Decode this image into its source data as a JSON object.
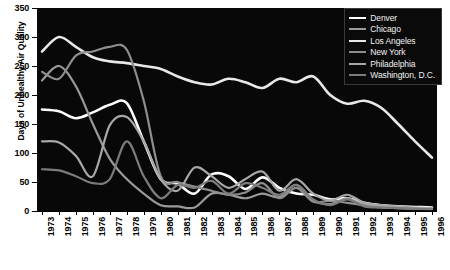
{
  "chart_data": {
    "type": "line",
    "xlabel": "",
    "ylabel": "Days of Unhealthy Air Quality",
    "xlim": [
      1973,
      1996
    ],
    "ylim": [
      0,
      350
    ],
    "ytick_step": 50,
    "grid": false,
    "legend_position": "top-right",
    "background": "#080808",
    "x": [
      1973,
      1974,
      1975,
      1976,
      1977,
      1978,
      1979,
      1980,
      1981,
      1982,
      1983,
      1984,
      1985,
      1986,
      1987,
      1988,
      1989,
      1990,
      1991,
      1992,
      1993,
      1994,
      1995,
      1996
    ],
    "categories": [
      "1973",
      "1974",
      "1975",
      "1976",
      "1977",
      "1978",
      "1979",
      "1980",
      "1981",
      "1982",
      "1983",
      "1984",
      "1985",
      "1986",
      "1987",
      "1988",
      "1989",
      "1990",
      "1991",
      "1992",
      "1993",
      "1994",
      "1995",
      "1996"
    ],
    "series": [
      {
        "name": "Denver",
        "color": "#ffffff",
        "width": 2.6,
        "values": [
          175,
          172,
          160,
          170,
          183,
          186,
          120,
          55,
          47,
          30,
          63,
          60,
          38,
          58,
          40,
          30,
          28,
          20,
          22,
          14,
          10,
          8,
          7,
          6
        ]
      },
      {
        "name": "Chicago",
        "color": "#9a9a9a",
        "width": 2.2,
        "values": [
          225,
          250,
          215,
          150,
          90,
          55,
          30,
          10,
          8,
          6,
          30,
          28,
          22,
          30,
          24,
          45,
          18,
          12,
          22,
          10,
          6,
          5,
          4,
          4
        ]
      },
      {
        "name": "Los Angeles",
        "color": "#e8e8e8",
        "width": 2.6,
        "values": [
          275,
          300,
          283,
          265,
          258,
          255,
          250,
          245,
          232,
          222,
          218,
          228,
          222,
          212,
          228,
          222,
          232,
          200,
          185,
          190,
          178,
          150,
          120,
          92
        ]
      },
      {
        "name": "New York",
        "color": "#8e8e8e",
        "width": 2.2,
        "values": [
          240,
          228,
          268,
          275,
          283,
          278,
          190,
          60,
          50,
          42,
          35,
          28,
          32,
          48,
          22,
          40,
          16,
          18,
          14,
          10,
          8,
          6,
          5,
          4
        ]
      },
      {
        "name": "Philadelphia",
        "color": "#a8a8a8",
        "width": 2.2,
        "values": [
          120,
          118,
          95,
          60,
          148,
          162,
          120,
          55,
          35,
          75,
          60,
          40,
          55,
          68,
          35,
          55,
          30,
          18,
          28,
          14,
          10,
          8,
          6,
          5
        ]
      },
      {
        "name": "Washington, D.C.",
        "color": "#7c7c7c",
        "width": 2.2,
        "values": [
          72,
          70,
          60,
          48,
          55,
          120,
          60,
          22,
          45,
          40,
          52,
          30,
          48,
          40,
          28,
          45,
          20,
          10,
          20,
          8,
          6,
          5,
          4,
          3
        ]
      }
    ]
  },
  "y_axis": {
    "ticks": [
      "0",
      "50",
      "100",
      "150",
      "200",
      "250",
      "300",
      "350"
    ],
    "title": "Days of Unhealthy Air Quality"
  },
  "legend": {
    "items": [
      {
        "label": "Denver"
      },
      {
        "label": "Chicago"
      },
      {
        "label": "Los Angeles"
      },
      {
        "label": "New York"
      },
      {
        "label": "Philadelphia"
      },
      {
        "label": "Washington, D.C."
      }
    ]
  }
}
